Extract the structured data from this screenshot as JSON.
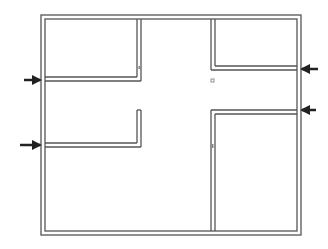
{
  "diagram": {
    "type": "floor-plan",
    "wall_color": "#555555",
    "arrow_color": "#222222",
    "background": "#ffffff",
    "walls": {
      "outer": {
        "x": 41,
        "y": 15,
        "w": 260,
        "h": 220
      },
      "inner_offset": 4
    },
    "rooms": [
      {
        "name": "top-left-room"
      },
      {
        "name": "bottom-left-room"
      },
      {
        "name": "top-right-room"
      },
      {
        "name": "bottom-right-room"
      },
      {
        "name": "central-corridor"
      }
    ],
    "arrows": [
      {
        "name": "arrow-left-upper",
        "direction": "right",
        "y": 80
      },
      {
        "name": "arrow-left-lower",
        "direction": "right",
        "y": 145
      },
      {
        "name": "arrow-right-upper",
        "direction": "left",
        "y": 69
      },
      {
        "name": "arrow-right-lower",
        "direction": "left",
        "y": 110
      }
    ]
  }
}
